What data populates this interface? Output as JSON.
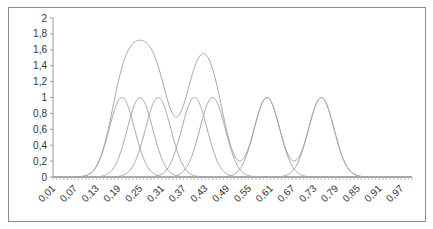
{
  "chart_data": {
    "type": "line",
    "title": "",
    "xlabel": "",
    "ylabel": "",
    "ylim": [
      0,
      2
    ],
    "yticks": [
      "0",
      "0,2",
      "0,4",
      "0,6",
      "0,8",
      "1",
      "1,2",
      "1,4",
      "1,6",
      "1,8",
      "2"
    ],
    "xlim": [
      0.01,
      1.0
    ],
    "x_step": 0.01,
    "xtick_labels": [
      "0,01",
      "0,07",
      "0,13",
      "0,19",
      "0,25",
      "0,31",
      "0,37",
      "0,43",
      "0,49",
      "0,55",
      "0,61",
      "0,67",
      "0,73",
      "0,79",
      "0,85",
      "0,91",
      "0,97"
    ],
    "grid": false,
    "legend": "none",
    "line_color": "#a8a8a8",
    "series_description": "Seven unit-height Gaussian curves and their sum",
    "gaussian_sigma": 0.035,
    "series": [
      {
        "name": "Gaussian 1",
        "center": 0.2,
        "peak": 1.0
      },
      {
        "name": "Gaussian 2",
        "center": 0.25,
        "peak": 1.0
      },
      {
        "name": "Gaussian 3",
        "center": 0.3,
        "peak": 1.0
      },
      {
        "name": "Gaussian 4",
        "center": 0.4,
        "peak": 1.0
      },
      {
        "name": "Gaussian 5",
        "center": 0.45,
        "peak": 1.0
      },
      {
        "name": "Gaussian 6",
        "center": 0.6,
        "peak": 1.0
      },
      {
        "name": "Gaussian 7",
        "center": 0.75,
        "peak": 1.0
      },
      {
        "name": "Sum",
        "key_points": [
          {
            "x": 0.25,
            "y": 1.73
          },
          {
            "x": 0.35,
            "y": 0.77
          },
          {
            "x": 0.425,
            "y": 1.56
          },
          {
            "x": 0.525,
            "y": 0.22
          },
          {
            "x": 0.6,
            "y": 1.0
          },
          {
            "x": 0.675,
            "y": 0.21
          },
          {
            "x": 0.75,
            "y": 1.0
          }
        ]
      }
    ]
  }
}
